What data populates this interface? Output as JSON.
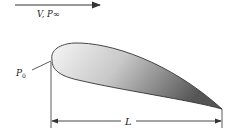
{
  "diagram": {
    "flow_label": "V, P∞",
    "stagnation_label": "P",
    "stagnation_subscript": "0",
    "length_label": "L",
    "colors": {
      "line": "#333333",
      "airfoil_light": "#f4f4f4",
      "airfoil_dark": "#5a5a5a"
    }
  }
}
